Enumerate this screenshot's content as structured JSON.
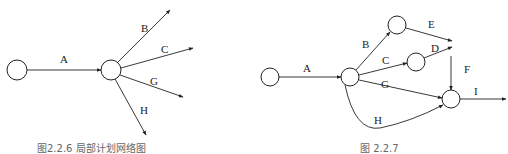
{
  "figures": [
    {
      "id": "left",
      "caption": "图2.2.6  局部计划网络图",
      "nodes": [
        {
          "id": "n1",
          "cx": 17,
          "cy": 70,
          "r": 10
        },
        {
          "id": "n2",
          "cx": 111,
          "cy": 70,
          "r": 10
        }
      ],
      "edges": [
        {
          "label": "A",
          "x1": 27,
          "y1": 70,
          "x2": 101,
          "y2": 70,
          "lx": 60,
          "ly": 63
        },
        {
          "label": "B",
          "x1": 118,
          "y1": 62,
          "x2": 170,
          "y2": 10,
          "lx": 141,
          "ly": 32
        },
        {
          "label": "C",
          "x1": 121,
          "y1": 68,
          "x2": 193,
          "y2": 48,
          "lx": 161,
          "ly": 53
        },
        {
          "label": "G",
          "x1": 120,
          "y1": 75,
          "x2": 183,
          "y2": 97,
          "lx": 150,
          "ly": 85
        },
        {
          "label": "H",
          "x1": 115,
          "y1": 79,
          "x2": 146,
          "y2": 135,
          "lx": 140,
          "ly": 114
        }
      ]
    },
    {
      "id": "right",
      "caption": "图 2.2.7",
      "nodes": [
        {
          "id": "m1",
          "cx": 270,
          "cy": 77,
          "r": 9
        },
        {
          "id": "m2",
          "cx": 350,
          "cy": 77,
          "r": 9
        },
        {
          "id": "m3",
          "cx": 397,
          "cy": 25,
          "r": 9
        },
        {
          "id": "m4",
          "cx": 416,
          "cy": 62,
          "r": 9
        },
        {
          "id": "m5",
          "cx": 451,
          "cy": 99,
          "r": 9
        }
      ],
      "edges": [
        {
          "label": "A",
          "x1": 279,
          "y1": 77,
          "x2": 341,
          "y2": 77,
          "lx": 303,
          "ly": 72
        },
        {
          "label": "B",
          "x1": 356,
          "y1": 70,
          "x2": 390,
          "y2": 32,
          "lx": 362,
          "ly": 48
        },
        {
          "label": "C",
          "x1": 359,
          "y1": 75,
          "x2": 407,
          "y2": 63,
          "lx": 382,
          "ly": 64
        },
        {
          "label": "D",
          "x1": 424,
          "y1": 58,
          "x2": 452,
          "y2": 47,
          "lx": 431,
          "ly": 52
        },
        {
          "label": "E",
          "x1": 406,
          "y1": 28,
          "x2": 452,
          "y2": 41,
          "lx": 428,
          "ly": 28
        },
        {
          "label": "F",
          "x1": 451,
          "y1": 56,
          "x2": 451,
          "y2": 90,
          "lx": 464,
          "ly": 73
        },
        {
          "label": "G",
          "x1": 359,
          "y1": 80,
          "x2": 442,
          "y2": 98,
          "lx": 381,
          "ly": 88
        },
        {
          "label": "I",
          "x1": 460,
          "y1": 99,
          "x2": 506,
          "y2": 99,
          "lx": 474,
          "ly": 95
        }
      ],
      "curve_edge": {
        "label": "H",
        "d": "M 345 85 Q 355 132 380 128 Q 410 122 443 105",
        "lx": 374,
        "ly": 124
      }
    }
  ]
}
